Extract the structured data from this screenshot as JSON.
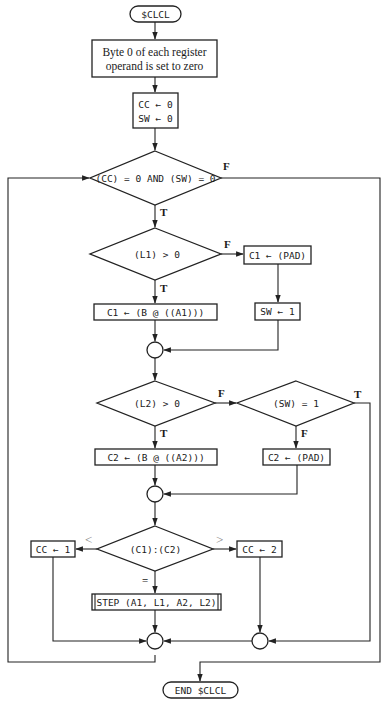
{
  "diagram": {
    "type": "flowchart",
    "start": {
      "label": "$CLCL"
    },
    "init_box": {
      "line1": "Byte 0 of each register",
      "line2": "operand is set to zero"
    },
    "cc_sw_box": {
      "line1": "CC ← 0",
      "line2": "SW ← 0"
    },
    "loop_condition": {
      "label": "(CC) = 0  AND  (SW) = 0",
      "true_label": "T",
      "false_label": "F"
    },
    "l1_condition": {
      "label": "(L1) > 0",
      "true_label": "T",
      "false_label": "F"
    },
    "c1_pad_box": {
      "label": "C1 ← (PAD)"
    },
    "sw_set_box": {
      "label": "SW ← 1"
    },
    "c1_fetch_box": {
      "label": "C1 ← (B @ ((A1)))"
    },
    "l2_condition": {
      "label": "(L2) > 0",
      "true_label": "T",
      "false_label": "F"
    },
    "sw_condition": {
      "label": "(SW) = 1",
      "true_label": "T",
      "false_label": "F"
    },
    "c2_fetch_box": {
      "label": "C2 ← (B @ ((A2)))"
    },
    "c2_pad_box": {
      "label": "C2 ← (PAD)"
    },
    "compare_condition": {
      "label": "(C1):(C2)",
      "less_label": "<",
      "greater_label": ">",
      "equal_label": "="
    },
    "cc1_box": {
      "label": "CC ← 1"
    },
    "cc2_box": {
      "label": "CC ← 2"
    },
    "step_box": {
      "label": "STEP (A1, L1, A2, L2)"
    },
    "end": {
      "label": "END $CLCL"
    }
  }
}
